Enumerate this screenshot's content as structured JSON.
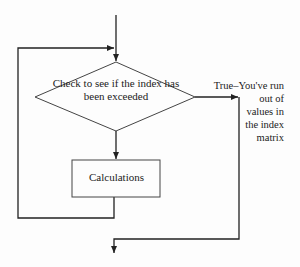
{
  "diagram": {
    "type": "flowchart",
    "colors": {
      "stroke": "#222222",
      "background": "#fdfdfd",
      "text": "#222222"
    },
    "nodes": {
      "decision": {
        "shape": "diamond",
        "label": "Check to see if the index has been exceeded"
      },
      "process": {
        "shape": "rectangle",
        "label": "Calculations"
      }
    },
    "edges": {
      "true_branch": {
        "label_lines": [
          "True–You've run",
          "out of",
          "values in",
          "the index",
          "matrix"
        ]
      }
    }
  }
}
